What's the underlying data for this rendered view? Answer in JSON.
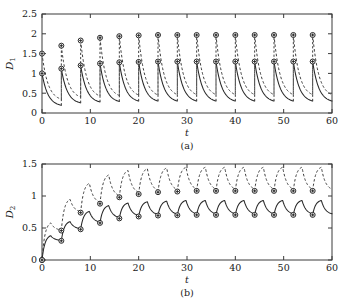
{
  "figure": {
    "panel_count": 2
  },
  "chart_data": [
    {
      "id": "panel-a",
      "type": "line",
      "title": "",
      "caption": "(a)",
      "xlabel": "t",
      "ylabel": "D",
      "ylabel_sub": "1",
      "xlim": [
        0,
        60
      ],
      "ylim": [
        0,
        2.5
      ],
      "xticks": [
        0,
        10,
        20,
        30,
        40,
        50,
        60
      ],
      "xticklabels": [
        "0",
        "10",
        "20",
        "30",
        "40",
        "50",
        "60"
      ],
      "yticks": [
        0,
        0.5,
        1,
        1.5,
        2,
        2.5
      ],
      "yticklabels": [
        "0",
        "0.5",
        "1",
        "1.5",
        "2",
        "2.5"
      ],
      "grid": false,
      "legend": "none",
      "period": 4,
      "description": "Sawtooth impulsive decay: each 4-unit cycle jumps up then decays convexly toward a low value.",
      "series": [
        {
          "name": "solid",
          "style": "solid",
          "cycles": [
            {
              "t_start": 0,
              "top": 1.0,
              "bottom": 0.16
            },
            {
              "t_start": 4,
              "top": 1.12,
              "bottom": 0.22
            },
            {
              "t_start": 8,
              "top": 1.2,
              "bottom": 0.24
            },
            {
              "t_start": 12,
              "top": 1.25,
              "bottom": 0.25
            },
            {
              "t_start": 16,
              "top": 1.28,
              "bottom": 0.26
            },
            {
              "t_start": 20,
              "top": 1.29,
              "bottom": 0.26
            },
            {
              "t_start": 24,
              "top": 1.3,
              "bottom": 0.26
            },
            {
              "t_start": 28,
              "top": 1.3,
              "bottom": 0.26
            },
            {
              "t_start": 32,
              "top": 1.3,
              "bottom": 0.26
            },
            {
              "t_start": 36,
              "top": 1.3,
              "bottom": 0.26
            },
            {
              "t_start": 40,
              "top": 1.3,
              "bottom": 0.26
            },
            {
              "t_start": 44,
              "top": 1.3,
              "bottom": 0.26
            },
            {
              "t_start": 48,
              "top": 1.3,
              "bottom": 0.26
            },
            {
              "t_start": 52,
              "top": 1.3,
              "bottom": 0.26
            },
            {
              "t_start": 56,
              "top": 1.3,
              "bottom": 0.26
            }
          ],
          "markers_t": [
            0,
            4,
            8,
            12,
            16,
            20,
            24,
            28,
            32,
            36,
            40,
            44,
            48,
            52,
            56
          ],
          "markers_v": [
            1.0,
            1.12,
            1.2,
            1.25,
            1.28,
            1.29,
            1.3,
            1.3,
            1.3,
            1.3,
            1.3,
            1.3,
            1.3,
            1.3,
            1.3
          ]
        },
        {
          "name": "dashed",
          "style": "dashed",
          "cycles": [
            {
              "t_start": 0,
              "top": 1.5,
              "bottom": 0.3
            },
            {
              "t_start": 4,
              "top": 1.7,
              "bottom": 0.35
            },
            {
              "t_start": 8,
              "top": 1.83,
              "bottom": 0.37
            },
            {
              "t_start": 12,
              "top": 1.9,
              "bottom": 0.38
            },
            {
              "t_start": 16,
              "top": 1.94,
              "bottom": 0.39
            },
            {
              "t_start": 20,
              "top": 1.96,
              "bottom": 0.39
            },
            {
              "t_start": 24,
              "top": 1.97,
              "bottom": 0.4
            },
            {
              "t_start": 28,
              "top": 1.97,
              "bottom": 0.4
            },
            {
              "t_start": 32,
              "top": 1.97,
              "bottom": 0.4
            },
            {
              "t_start": 36,
              "top": 1.97,
              "bottom": 0.4
            },
            {
              "t_start": 40,
              "top": 1.97,
              "bottom": 0.4
            },
            {
              "t_start": 44,
              "top": 1.97,
              "bottom": 0.4
            },
            {
              "t_start": 48,
              "top": 1.97,
              "bottom": 0.4
            },
            {
              "t_start": 52,
              "top": 1.97,
              "bottom": 0.4
            },
            {
              "t_start": 56,
              "top": 1.97,
              "bottom": 0.4
            }
          ],
          "markers_t": [
            0,
            4,
            8,
            12,
            16,
            20,
            24,
            28,
            32,
            36,
            40,
            44,
            48,
            52,
            56
          ],
          "markers_v": [
            1.5,
            1.7,
            1.83,
            1.9,
            1.94,
            1.96,
            1.97,
            1.97,
            1.97,
            1.97,
            1.97,
            1.97,
            1.97,
            1.97,
            1.97
          ]
        }
      ]
    },
    {
      "id": "panel-b",
      "type": "line",
      "title": "",
      "caption": "(b)",
      "xlabel": "t",
      "ylabel": "D",
      "ylabel_sub": "2",
      "xlim": [
        0,
        60
      ],
      "ylim": [
        0,
        1.5
      ],
      "xticks": [
        0,
        10,
        20,
        30,
        40,
        50,
        60
      ],
      "xticklabels": [
        "0",
        "10",
        "20",
        "30",
        "40",
        "50",
        "60"
      ],
      "yticks": [
        0,
        0.5,
        1,
        1.5
      ],
      "yticklabels": [
        "0",
        "0.5",
        "1",
        "1.5"
      ],
      "grid": false,
      "legend": "none",
      "period": 4,
      "description": "Scalloped rising oscillation from 0 saturating to a periodic steady state; markers at cycle minima.",
      "series": [
        {
          "name": "solid",
          "style": "solid",
          "cycles": [
            {
              "t_start": 0,
              "start": 0.0,
              "peak": 0.38,
              "end": 0.3
            },
            {
              "t_start": 4,
              "start": 0.3,
              "peak": 0.6,
              "end": 0.48
            },
            {
              "t_start": 8,
              "start": 0.48,
              "peak": 0.76,
              "end": 0.58
            },
            {
              "t_start": 12,
              "start": 0.58,
              "peak": 0.85,
              "end": 0.65
            },
            {
              "t_start": 16,
              "start": 0.65,
              "peak": 0.89,
              "end": 0.68
            },
            {
              "t_start": 20,
              "start": 0.68,
              "peak": 0.91,
              "end": 0.695
            },
            {
              "t_start": 24,
              "start": 0.695,
              "peak": 0.92,
              "end": 0.7
            },
            {
              "t_start": 28,
              "start": 0.7,
              "peak": 0.93,
              "end": 0.705
            },
            {
              "t_start": 32,
              "start": 0.705,
              "peak": 0.93,
              "end": 0.705
            },
            {
              "t_start": 36,
              "start": 0.705,
              "peak": 0.93,
              "end": 0.705
            },
            {
              "t_start": 40,
              "start": 0.705,
              "peak": 0.93,
              "end": 0.705
            },
            {
              "t_start": 44,
              "start": 0.705,
              "peak": 0.93,
              "end": 0.705
            },
            {
              "t_start": 48,
              "start": 0.705,
              "peak": 0.93,
              "end": 0.705
            },
            {
              "t_start": 52,
              "start": 0.705,
              "peak": 0.93,
              "end": 0.705
            },
            {
              "t_start": 56,
              "start": 0.705,
              "peak": 0.93,
              "end": 0.705
            }
          ],
          "markers_t": [
            0,
            4,
            8,
            12,
            16,
            20,
            24,
            28,
            32,
            36,
            40,
            44,
            48,
            52,
            56
          ],
          "markers_v": [
            0.0,
            0.3,
            0.48,
            0.58,
            0.65,
            0.68,
            0.695,
            0.7,
            0.705,
            0.705,
            0.705,
            0.705,
            0.705,
            0.705,
            0.705
          ]
        },
        {
          "name": "dashed",
          "style": "dashed",
          "cycles": [
            {
              "t_start": 0,
              "start": 0.0,
              "peak": 0.58,
              "end": 0.46
            },
            {
              "t_start": 4,
              "start": 0.46,
              "peak": 0.95,
              "end": 0.74
            },
            {
              "t_start": 8,
              "start": 0.74,
              "peak": 1.2,
              "end": 0.88
            },
            {
              "t_start": 12,
              "start": 0.88,
              "peak": 1.33,
              "end": 0.98
            },
            {
              "t_start": 16,
              "start": 0.98,
              "peak": 1.4,
              "end": 1.03
            },
            {
              "t_start": 20,
              "start": 1.03,
              "peak": 1.43,
              "end": 1.06
            },
            {
              "t_start": 24,
              "start": 1.06,
              "peak": 1.44,
              "end": 1.07
            },
            {
              "t_start": 28,
              "start": 1.07,
              "peak": 1.45,
              "end": 1.08
            },
            {
              "t_start": 32,
              "start": 1.08,
              "peak": 1.45,
              "end": 1.08
            },
            {
              "t_start": 36,
              "start": 1.08,
              "peak": 1.45,
              "end": 1.08
            },
            {
              "t_start": 40,
              "start": 1.08,
              "peak": 1.45,
              "end": 1.08
            },
            {
              "t_start": 44,
              "start": 1.08,
              "peak": 1.45,
              "end": 1.08
            },
            {
              "t_start": 48,
              "start": 1.08,
              "peak": 1.45,
              "end": 1.08
            },
            {
              "t_start": 52,
              "start": 1.08,
              "peak": 1.45,
              "end": 1.08
            },
            {
              "t_start": 56,
              "start": 1.08,
              "peak": 1.45,
              "end": 1.08
            }
          ],
          "markers_t": [
            0,
            4,
            8,
            12,
            16,
            20,
            24,
            28,
            32,
            36,
            40,
            44,
            48,
            52,
            56
          ],
          "markers_v": [
            0.0,
            0.46,
            0.74,
            0.88,
            0.98,
            1.03,
            1.06,
            1.07,
            1.08,
            1.08,
            1.08,
            1.08,
            1.08,
            1.08,
            1.08
          ]
        }
      ]
    }
  ]
}
